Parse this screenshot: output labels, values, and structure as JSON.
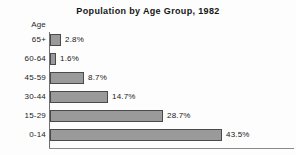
{
  "chart_data": {
    "type": "bar",
    "orientation": "horizontal",
    "title": "Population by Age Group, 1982",
    "xlabel": "",
    "ylabel": "Age",
    "categories": [
      "65+",
      "60-64",
      "45-59",
      "30-44",
      "15-29",
      "0-14"
    ],
    "values": [
      2.8,
      1.6,
      8.7,
      14.7,
      28.7,
      43.5
    ],
    "value_labels": [
      "2.8%",
      "1.6%",
      "8.7%",
      "14.7%",
      "28.7%",
      "43.5%"
    ],
    "unit": "%",
    "xlim": [
      0,
      43.5
    ],
    "grid": false,
    "legend": false,
    "bar_color": "#9a9a9a",
    "bar_border_color": "#4a4a4a",
    "background_color": "#fdfdfd",
    "text_color": "#111111"
  },
  "axis": {
    "name": "Age"
  }
}
